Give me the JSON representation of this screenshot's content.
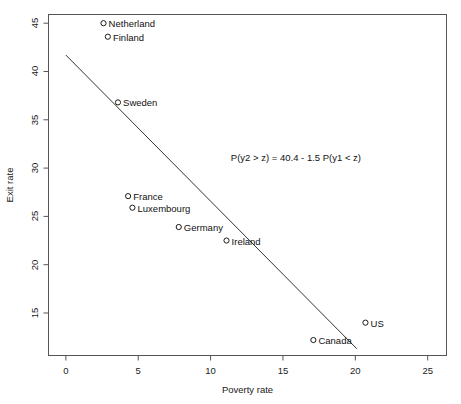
{
  "chart_data": {
    "type": "scatter",
    "title": "",
    "xlabel": "Poverty rate",
    "ylabel": "Exit rate",
    "xlim": [
      -1.2,
      26.3
    ],
    "ylim": [
      10.6,
      45.9
    ],
    "xticks": [
      "0",
      "5",
      "10",
      "15",
      "20",
      "25"
    ],
    "xtick_values": [
      0,
      5,
      10,
      15,
      20,
      25
    ],
    "yticks": [
      "15",
      "20",
      "25",
      "30",
      "35",
      "40",
      "45"
    ],
    "ytick_values": [
      15,
      20,
      25,
      30,
      35,
      40,
      45
    ],
    "grid": false,
    "legend": null,
    "points": [
      {
        "label": "Netherland",
        "x": 2.6,
        "y": 45.0,
        "label_side": "right"
      },
      {
        "label": "Finland",
        "x": 2.9,
        "y": 43.6,
        "label_side": "right"
      },
      {
        "label": "Sweden",
        "x": 3.6,
        "y": 36.8,
        "label_side": "right"
      },
      {
        "label": "France",
        "x": 4.3,
        "y": 27.1,
        "label_side": "right"
      },
      {
        "label": "Luxembourg",
        "x": 4.6,
        "y": 25.9,
        "label_side": "right"
      },
      {
        "label": "Germany",
        "x": 7.8,
        "y": 23.9,
        "label_side": "right"
      },
      {
        "label": "Ireland",
        "x": 11.1,
        "y": 22.5,
        "label_side": "right"
      },
      {
        "label": "Canada",
        "x": 17.1,
        "y": 12.2,
        "label_side": "right"
      },
      {
        "label": "US",
        "x": 20.7,
        "y": 14.0,
        "label_side": "right"
      }
    ],
    "fit_line": {
      "intercept": 40.4,
      "slope": -1.5,
      "x_start": 0.0,
      "y_start": 41.7,
      "x_end": 20.1,
      "y_end": 11.3
    },
    "annotation": {
      "text": "P(y2 > z) = 40.4  - 1.5 P(y1 < z)",
      "x": 11.4,
      "y": 31.1
    },
    "marker": {
      "shape": "open-circle",
      "radius": 2.6,
      "color": "#1a1a1a"
    },
    "colors": {
      "axis": "#555555",
      "line": "#333333",
      "text": "#111111",
      "background": "#ffffff"
    }
  }
}
